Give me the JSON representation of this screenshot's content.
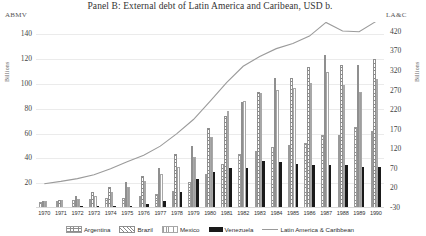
{
  "chart_data": {
    "type": "bar",
    "title": "Panel B: External debt of Latin America and Caribean, USD b.",
    "xlabel": "",
    "ylabel": "Billions",
    "left_axis": {
      "name": "ABMV",
      "unit": "Billions",
      "ticks": [
        140,
        120,
        100,
        80,
        60,
        40,
        20
      ],
      "ylim": [
        0,
        150
      ]
    },
    "right_axis": {
      "name": "LA&C",
      "unit": "Billions",
      "ticks": [
        420,
        370,
        320,
        270,
        220,
        170,
        120,
        70,
        20,
        -30
      ],
      "ylim": [
        -30,
        445
      ]
    },
    "grid": true,
    "legend_position": "bottom",
    "categories": [
      "1970",
      "1971",
      "1972",
      "1973",
      "1974",
      "1975",
      "1976",
      "1977",
      "1978",
      "1979",
      "1980",
      "1981",
      "1982",
      "1983",
      "1984",
      "1985",
      "1986",
      "1987",
      "1988",
      "1989",
      "1990"
    ],
    "series": [
      {
        "name": "Argentina",
        "axis": "left",
        "pattern": "checker",
        "values": [
          5.2,
          5.6,
          6.4,
          6.9,
          8.1,
          8.2,
          9.7,
          11.4,
          13.6,
          20.9,
          27.2,
          35.7,
          43.6,
          45.9,
          48.9,
          50.9,
          52.5,
          58.5,
          58.9,
          65.3,
          62.2
        ]
      },
      {
        "name": "Brazil",
        "axis": "left",
        "pattern": "diagonal",
        "values": [
          5.3,
          6.6,
          9.5,
          12.6,
          17.2,
          21.2,
          25.9,
          32.0,
          43.5,
          49.9,
          64.3,
          73.9,
          85.3,
          93.6,
          105.2,
          105.2,
          113.8,
          123.8,
          115.7,
          115.1,
          119.9
        ]
      },
      {
        "name": "Mexico",
        "axis": "left",
        "pattern": "vertical",
        "values": [
          5.8,
          6.8,
          7.5,
          9.9,
          12.8,
          16.9,
          21.8,
          27.1,
          32.9,
          40.8,
          57.4,
          78.2,
          86.1,
          93.0,
          94.8,
          96.9,
          100.9,
          109.5,
          99.2,
          93.8,
          104.4
        ]
      },
      {
        "name": "Venezuela",
        "axis": "left",
        "pattern": "solid",
        "values": [
          1.0,
          1.2,
          1.4,
          1.5,
          1.6,
          1.8,
          3.3,
          6.0,
          13.3,
          23.7,
          29.3,
          32.1,
          32.2,
          38.3,
          36.9,
          35.3,
          34.4,
          35.0,
          34.7,
          33.1,
          33.2
        ]
      },
      {
        "name": "Latin America & Caribbean",
        "axis": "right",
        "type": "line",
        "values": [
          32,
          38,
          45,
          55,
          70,
          88,
          105,
          128,
          160,
          196,
          242,
          290,
          332,
          357,
          377,
          390,
          409,
          444,
          422,
          420,
          446
        ]
      }
    ]
  },
  "legend": {
    "items": [
      {
        "label": "Argentina"
      },
      {
        "label": "Brazil"
      },
      {
        "label": "Mexico"
      },
      {
        "label": "Venezuela"
      },
      {
        "label": "Latin America & Caribbean"
      }
    ]
  }
}
